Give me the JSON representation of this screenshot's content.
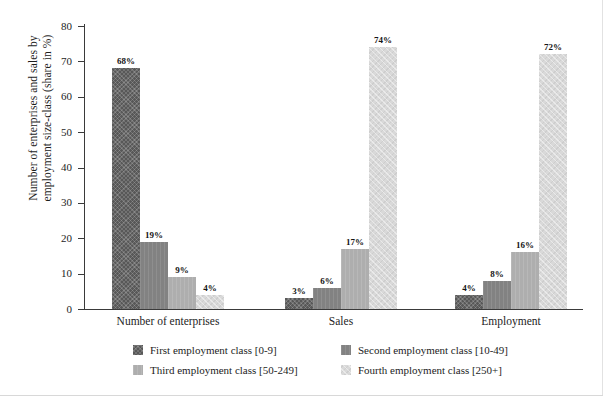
{
  "chart_data": {
    "type": "bar",
    "title": "",
    "xlabel": "",
    "ylabel": "Number of enterprises and sales by employment size-class (share in %)",
    "ylabel_line1": "Number of enterprises and sales by",
    "ylabel_line2": "employment size-class (share in %)",
    "ylim": [
      0,
      80
    ],
    "yticks": [
      0,
      10,
      20,
      30,
      40,
      50,
      60,
      70,
      80
    ],
    "ytick_labels": [
      "0",
      "10",
      "20",
      "30",
      "40",
      "50",
      "60",
      "70",
      "80"
    ],
    "grid": false,
    "legend_position": "bottom",
    "value_suffix": "%",
    "categories": [
      "Number of enterprises",
      "Sales",
      "Employment"
    ],
    "series": [
      {
        "name": "First employment class [0-9]",
        "color": "#585858",
        "values": [
          68,
          3,
          4
        ],
        "labels": [
          "68%",
          "3%",
          "4%"
        ]
      },
      {
        "name": "Second employment class [10-49]",
        "color": "#828282",
        "values": [
          19,
          6,
          8
        ],
        "labels": [
          "19%",
          "6%",
          "8%"
        ]
      },
      {
        "name": "Third employment class [50-249]",
        "color": "#aeaeae",
        "values": [
          9,
          17,
          16
        ],
        "labels": [
          "9%",
          "17%",
          "16%"
        ]
      },
      {
        "name": "Fourth employment class [250+]",
        "color": "#d9d9d9",
        "values": [
          4,
          74,
          72
        ],
        "labels": [
          "4%",
          "74%",
          "72%"
        ]
      }
    ]
  },
  "legend": {
    "items": [
      {
        "label": "First employment class [0-9]",
        "series_index": 0
      },
      {
        "label": "Second employment class [10-49]",
        "series_index": 1
      },
      {
        "label": "Third employment class [50-249]",
        "series_index": 2
      },
      {
        "label": "Fourth employment class [250+]",
        "series_index": 3
      }
    ]
  }
}
